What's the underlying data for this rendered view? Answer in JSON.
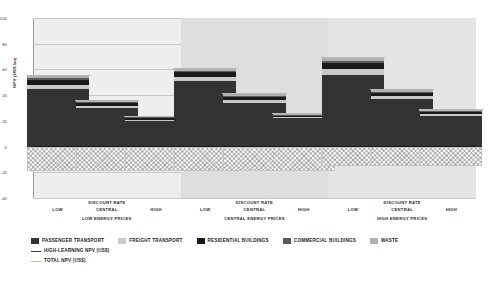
{
  "chart_data": {
    "type": "bar",
    "title": "",
    "xlabel": "DISCOUNT RATE",
    "ylabel": "NPV (US$ bn)",
    "ylim": [
      -40,
      100
    ],
    "yticks": [
      100,
      80,
      60,
      40,
      20,
      0,
      -20,
      -40
    ],
    "grid": true,
    "legend_position": "bottom",
    "stacked": true,
    "group_label_key": "ENERGY PRICES",
    "groups": [
      {
        "name": "LOW ENERGY PRICES",
        "categories": [
          "LOW",
          "CENTRAL",
          "HIGH"
        ]
      },
      {
        "name": "CENTRAL ENERGY PRICES",
        "categories": [
          "LOW",
          "CENTRAL",
          "HIGH"
        ]
      },
      {
        "name": "HIGH ENERGY PRICES",
        "categories": [
          "LOW",
          "CENTRAL",
          "HIGH"
        ]
      }
    ],
    "categories": [
      "LOW / LOW ENERGY PRICES",
      "CENTRAL / LOW ENERGY PRICES",
      "HIGH / LOW ENERGY PRICES",
      "LOW / CENTRAL ENERGY PRICES",
      "CENTRAL / CENTRAL ENERGY PRICES",
      "HIGH / CENTRAL ENERGY PRICES",
      "LOW / HIGH ENERGY PRICES",
      "CENTRAL / HIGH ENERGY PRICES",
      "HIGH / HIGH ENERGY PRICES"
    ],
    "series": [
      {
        "name": "PASSENGER TRANSPORT",
        "color": "#333333",
        "values": [
          45,
          30,
          20,
          51,
          34,
          22,
          56,
          37,
          24
        ]
      },
      {
        "name": "FREIGHT TRANSPORT",
        "color": "#c9c9c9",
        "values": [
          3,
          1.5,
          1,
          3,
          2,
          1,
          4,
          2,
          1
        ]
      },
      {
        "name": "RESIDENTIAL BUILDINGS",
        "color": "#1a1a1a",
        "values": [
          4,
          2.5,
          1.5,
          4,
          3,
          1.5,
          5,
          3,
          2
        ]
      },
      {
        "name": "COMMERCIAL BUILDINGS",
        "color": "#5a5a5a",
        "values": [
          1,
          0.6,
          0.4,
          1,
          0.7,
          0.4,
          1.2,
          0.8,
          0.5
        ]
      },
      {
        "name": "WASTE",
        "color": "#b0b0b0",
        "values": [
          2,
          1.2,
          0.8,
          2,
          1.3,
          0.8,
          3,
          1.5,
          1
        ]
      }
    ],
    "negative_series": {
      "name": "NEGATIVE NPV (hatched)",
      "values": [
        -19,
        -19,
        -19,
        -19,
        -19,
        -19,
        -15,
        -15,
        -15
      ]
    },
    "reference_lines": [
      {
        "name": "HIGH-LEARNING NPV (US$)",
        "style": "solid",
        "color": "#3d3d3d"
      },
      {
        "name": "TOTAL NPV (US$)",
        "style": "solid",
        "color": "#b9b9b9"
      }
    ],
    "bar_totals": [
      55,
      35.8,
      23.7,
      61,
      41,
      25.7,
      69.2,
      44.3,
      28.5
    ]
  },
  "legend": {
    "swatch_items": [
      {
        "label": "PASSENGER TRANSPORT",
        "color": "#333333"
      },
      {
        "label": "FREIGHT TRANSPORT",
        "color": "#c9c9c9"
      },
      {
        "label": "RESIDENTIAL BUILDINGS",
        "color": "#1a1a1a"
      },
      {
        "label": "COMMERCIAL BUILDINGS",
        "color": "#5a5a5a"
      },
      {
        "label": "WASTE",
        "color": "#b0b0b0"
      }
    ],
    "line_items": [
      {
        "label": "HIGH-LEARNING NPV (US$)",
        "color": "#3d3d3d"
      },
      {
        "label": "TOTAL NPV (US$)",
        "color": "#b9b9b9"
      }
    ]
  },
  "axis": {
    "y_title": "NPV (US$ bn)",
    "x_title": "DISCOUNT RATE",
    "y_tick_labels": [
      "100",
      "80",
      "60",
      "40",
      "20",
      "0",
      "-20",
      "-40"
    ]
  }
}
